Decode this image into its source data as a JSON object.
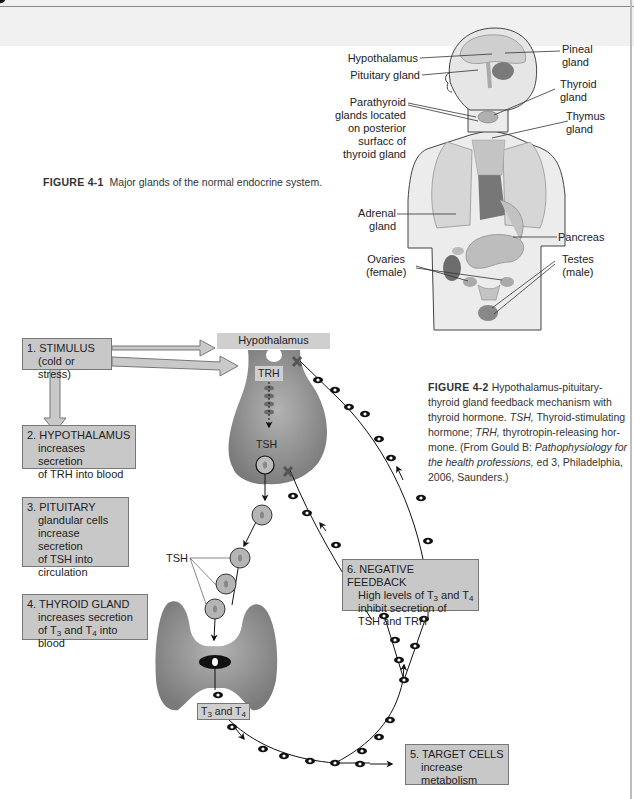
{
  "figure_4_1": {
    "caption_label": "FIGURE 4-1",
    "caption_text": "Major glands of the normal endocrine system.",
    "labels": {
      "hypothalamus": "Hypothalamus",
      "pituitary": "Pituitary gland",
      "parathyroid_1": "Parathyroid",
      "parathyroid_2": "glands located",
      "parathyroid_3": "on posterior",
      "parathyroid_4": "surfacc of",
      "parathyroid_5": "thyroid gland",
      "adrenal_1": "Adrenal",
      "adrenal_2": "gland",
      "ovaries_1": "Ovaries",
      "ovaries_2": "(female)",
      "pineal_1": "Pineal",
      "pineal_2": "gland",
      "thyroid_1": "Thyroid",
      "thyroid_2": "gland",
      "thymus_1": "Thymus",
      "thymus_2": "gland",
      "pancreas": "Pancreas",
      "testes_1": "Testes",
      "testes_2": "(male)"
    }
  },
  "figure_4_2": {
    "caption_label": "FIGURE 4-2",
    "caption_lines": [
      "Hypothalamus-pituitary-",
      "thyroid gland feedback mechanism with",
      "thyroid hormone.",
      "TSH,",
      "Thyroid-stimulating",
      "hormone;",
      "TRH,",
      "thyrotropin-releasing hor-",
      "mone. (From Gould B:",
      "Pathophysiology for",
      "the health professions,",
      "ed 3, Philadelphia,",
      "2006, Saunders.)"
    ],
    "tags": {
      "hypothalamus": "Hypothalamus",
      "trh": "TRH",
      "tsh_inside": "TSH",
      "tsh_label": "TSH",
      "t3_t4_pre": "T",
      "t3_t4_a": "3",
      "t3_t4_mid": " and T",
      "t3_t4_b": "4"
    },
    "steps": [
      {
        "title": "1. STIMULUS",
        "lines": [
          "(cold or stress)"
        ]
      },
      {
        "title": "2. HYPOTHALAMUS",
        "lines": [
          "increases secretion",
          "of TRH into blood"
        ]
      },
      {
        "title": "3. PITUITARY",
        "lines": [
          "glandular cells",
          "increase secretion",
          "of TSH into",
          "circulation"
        ]
      },
      {
        "title": "4. THYROID GLAND",
        "lines": [
          "increases secretion",
          "of T",
          "3",
          " and T",
          "4",
          " into blood"
        ]
      },
      {
        "title": "5. TARGET CELLS",
        "lines": [
          "increase",
          "metabolism"
        ]
      },
      {
        "title": "6. NEGATIVE FEEDBACK",
        "lines": [
          "High levels of T",
          "3",
          " and T",
          "4",
          "inhibit secretion of",
          "TSH and TRH"
        ]
      }
    ]
  }
}
